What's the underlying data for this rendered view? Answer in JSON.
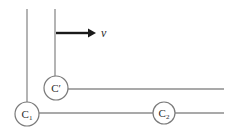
{
  "diagram": {
    "velocity_label": "v",
    "circles": {
      "c_prime": {
        "main": "C",
        "mark": "′"
      },
      "c1": {
        "main": "C",
        "sub": "1"
      },
      "c2": {
        "main": "C",
        "sub": "2"
      }
    },
    "colors": {
      "background": "#ffffff",
      "line": "#8c8c8c",
      "circle_stroke": "#7a7a7a",
      "circle_fill": "#ffffff",
      "arrow": "#1a1a1a",
      "text": "#2b2b2b"
    }
  }
}
